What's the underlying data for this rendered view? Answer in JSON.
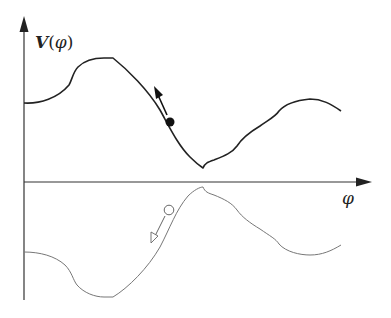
{
  "figure": {
    "y_axis_label": {
      "symbol": "V",
      "open": "(",
      "arg": "φ",
      "close": ")"
    },
    "x_axis_label": "φ",
    "colors": {
      "axis": "#222222",
      "upper_curve": "#222222",
      "lower_curve": "#777777",
      "ball_filled": "#111111",
      "ball_hollow_stroke": "#666666"
    },
    "elements": [
      {
        "name": "potential-curve",
        "description": "Upper potential V(φ) curve with bump, plateau, descent to minimum, rise and fall"
      },
      {
        "name": "filled-ball",
        "description": "Solid ball on descending slope with arrow pointing up the slope"
      },
      {
        "name": "inverted-curve",
        "description": "Lower mirrored (inverted) potential curve"
      },
      {
        "name": "hollow-ball",
        "description": "Hollow ball on inverted curve with arrow pointing down the slope"
      }
    ]
  }
}
